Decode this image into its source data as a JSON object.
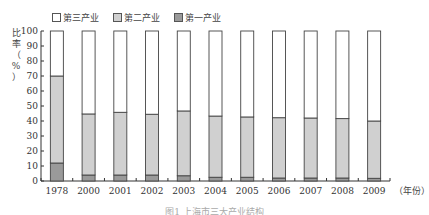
{
  "chart_data": {
    "type": "bar",
    "stacked": true,
    "title": "",
    "xlabel": "（年份）",
    "ylabel": "比率（%）",
    "ylim": [
      0,
      100
    ],
    "yticks": [
      0,
      10,
      20,
      30,
      40,
      50,
      60,
      70,
      80,
      90,
      100
    ],
    "grid": false,
    "legend_position": "top",
    "categories": [
      "1978",
      "2000",
      "2001",
      "2002",
      "2003",
      "2004",
      "2005",
      "2006",
      "2007",
      "2008",
      "2009"
    ],
    "series": [
      {
        "name": "第一产业",
        "color": "#9a9a9a",
        "values": [
          12,
          4,
          4,
          4,
          3.5,
          2.5,
          2.5,
          2,
          2,
          2,
          1.8
        ]
      },
      {
        "name": "第二产业",
        "color": "#d0d0d0",
        "values": [
          58,
          40.7,
          41.8,
          40.5,
          43.2,
          40.8,
          40.2,
          40.2,
          40,
          39.6,
          38.2
        ]
      },
      {
        "name": "第三产业",
        "color": "#ffffff",
        "values": [
          30,
          55.3,
          54.2,
          55.5,
          53.3,
          56.7,
          57.3,
          57.8,
          58,
          58.4,
          60
        ]
      }
    ]
  },
  "legend": [
    {
      "label": "第三产业",
      "color": "#ffffff"
    },
    {
      "label": "第二产业",
      "color": "#d0d0d0"
    },
    {
      "label": "第一产业",
      "color": "#9a9a9a"
    }
  ],
  "ylabel_chars": [
    "比",
    "率",
    "（",
    "%",
    "）"
  ],
  "caption": "图1  上海市三大产业结构"
}
